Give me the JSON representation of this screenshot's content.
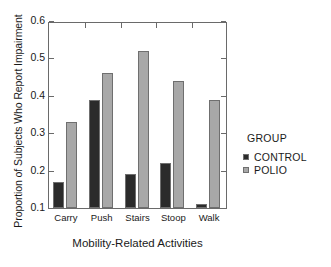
{
  "chart_data": {
    "type": "bar",
    "title": "",
    "xlabel": "Mobility-Related Activities",
    "ylabel": "Proportion of Subjects Who Report Impairment",
    "categories": [
      "Carry",
      "Push",
      "Stairs",
      "Stoop",
      "Walk"
    ],
    "series": [
      {
        "name": "CONTROL",
        "values": [
          0.17,
          0.39,
          0.19,
          0.22,
          0.11
        ],
        "color": "#2b2b2b"
      },
      {
        "name": "POLIO",
        "values": [
          0.33,
          0.46,
          0.52,
          0.44,
          0.39
        ],
        "color": "#a8a8a8"
      }
    ],
    "ylim": [
      0.1,
      0.6
    ],
    "yticks": [
      0.1,
      0.2,
      0.3,
      0.4,
      0.5,
      0.6
    ],
    "ytick_labels": [
      "0.1",
      "0.2",
      "0.3",
      "0.4",
      "0.5",
      "0.6"
    ],
    "grid": false,
    "legend_position": "right",
    "legend_title": "GROUP"
  },
  "axis_colors": {
    "frame": "#6a6a6a",
    "bar_outline": "#6f6f6f",
    "text": "#1a1a1a"
  }
}
